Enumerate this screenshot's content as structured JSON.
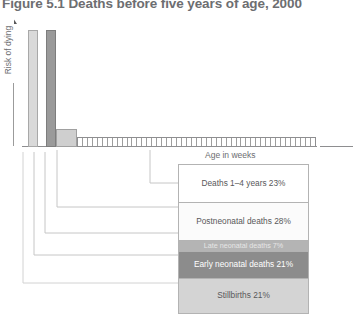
{
  "figure": {
    "title": "Figure 5.1 Deaths before five years of age, 2000",
    "y_axis_label": "Risk of dying",
    "x_axis_label": "Age in weeks",
    "y_axis_arrow": "up-arrow-icon"
  },
  "chart_data": {
    "type": "bar",
    "title": "Figure 5.1 Deaths before five years of age, 2000",
    "xlabel": "Age in weeks",
    "ylabel": "Risk of dying",
    "grid": false,
    "legend_position": "bottom-right",
    "categories": [
      "Stillbirths",
      "Early neonatal deaths",
      "Late neonatal deaths",
      "Postneonatal deaths",
      "Deaths 1-4 years"
    ],
    "values": [
      21,
      21,
      7,
      28,
      23
    ],
    "value_unit": "percent",
    "series": [
      {
        "name": "Share of deaths before five years of age",
        "values": [
          21,
          21,
          7,
          28,
          23
        ]
      }
    ],
    "bars": [
      {
        "name": "Stillbirths",
        "risk": 100,
        "width_weeks": 0.5,
        "color": "#d9d9d9"
      },
      {
        "name": "Early neonatal deaths",
        "risk": 100,
        "width_weeks": 0.5,
        "color": "#9a9a9a"
      },
      {
        "name": "Late neonatal deaths",
        "risk": 15,
        "width_weeks": 3,
        "color": "#cfcfcf"
      },
      {
        "name": "Postneonatal and 1-4 years",
        "risk": 8,
        "width_weeks": 48,
        "color": "#ffffff"
      }
    ],
    "week_segments": 48
  },
  "legend": {
    "rows": [
      {
        "label": "Deaths 1–4 years 23%",
        "color": "#ffffff",
        "text_color": "#58585a"
      },
      {
        "label": "Postneonatal deaths 28%",
        "color": "#fbfbfb",
        "text_color": "#58585a"
      },
      {
        "label": "Late neonatal deaths 7%",
        "color": "#b4b4b4",
        "text_color": "#e6e6e6"
      },
      {
        "label": "Early neonatal deaths 21%",
        "color": "#8c8c8c",
        "text_color": "#ffffff"
      },
      {
        "label": "Stillbirths 21%",
        "color": "#d4d4d4",
        "text_color": "#58585a"
      }
    ]
  },
  "colors": {
    "axis": "#8e8e90",
    "text": "#58585a",
    "title": "#6d6e71",
    "leader_line": "#bcbcbc"
  }
}
